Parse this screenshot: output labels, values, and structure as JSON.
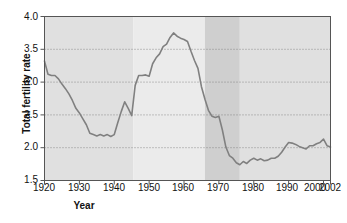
{
  "chart_data": {
    "type": "line",
    "title": "",
    "xlabel": "Year",
    "ylabel": "Total fertility rate",
    "xlim": [
      1920,
      2002
    ],
    "ylim": [
      1.5,
      4.0
    ],
    "grid": true,
    "legend": "none",
    "yticks": [
      "4.0",
      "3.5",
      "3.0",
      "2.5",
      "2.0",
      "1.5"
    ],
    "ytick_values": [
      4.0,
      3.5,
      3.0,
      2.5,
      2.0,
      1.5
    ],
    "xticks": [
      "1920",
      "1930",
      "1940",
      "1950",
      "1960",
      "1970",
      "1980",
      "1990",
      "2000",
      "2002"
    ],
    "xtick_values": [
      1920,
      1930,
      1940,
      1950,
      1960,
      1970,
      1980,
      1990,
      2000,
      2002
    ],
    "series": [
      {
        "name": "Total fertility rate",
        "color": "#808080",
        "x": [
          1920,
          1921,
          1922,
          1923,
          1924,
          1925,
          1926,
          1927,
          1928,
          1929,
          1930,
          1931,
          1932,
          1933,
          1934,
          1935,
          1936,
          1937,
          1938,
          1939,
          1940,
          1941,
          1942,
          1943,
          1944,
          1945,
          1946,
          1947,
          1948,
          1949,
          1950,
          1951,
          1952,
          1953,
          1954,
          1955,
          1956,
          1957,
          1958,
          1959,
          1960,
          1961,
          1962,
          1963,
          1964,
          1965,
          1966,
          1967,
          1968,
          1969,
          1970,
          1971,
          1972,
          1973,
          1974,
          1975,
          1976,
          1977,
          1978,
          1979,
          1980,
          1981,
          1982,
          1983,
          1984,
          1985,
          1986,
          1987,
          1988,
          1989,
          1990,
          1991,
          1992,
          1993,
          1994,
          1995,
          1996,
          1997,
          1998,
          1999,
          2000,
          2001,
          2002
        ],
        "y": [
          3.32,
          3.12,
          3.1,
          3.1,
          3.05,
          2.97,
          2.9,
          2.82,
          2.72,
          2.6,
          2.53,
          2.44,
          2.35,
          2.22,
          2.2,
          2.18,
          2.2,
          2.18,
          2.2,
          2.17,
          2.2,
          2.38,
          2.55,
          2.7,
          2.6,
          2.49,
          2.95,
          3.1,
          3.1,
          3.11,
          3.09,
          3.28,
          3.37,
          3.43,
          3.54,
          3.58,
          3.68,
          3.75,
          3.7,
          3.67,
          3.65,
          3.62,
          3.47,
          3.33,
          3.21,
          2.93,
          2.74,
          2.57,
          2.48,
          2.46,
          2.48,
          2.27,
          2.01,
          1.88,
          1.84,
          1.77,
          1.74,
          1.79,
          1.76,
          1.81,
          1.84,
          1.81,
          1.83,
          1.8,
          1.81,
          1.84,
          1.84,
          1.87,
          1.93,
          2.01,
          2.08,
          2.07,
          2.05,
          2.02,
          2.0,
          1.98,
          2.03,
          2.03,
          2.06,
          2.08,
          2.13,
          2.03,
          2.01
        ]
      }
    ],
    "bands": [
      {
        "name": "pre-boom",
        "start": 1920,
        "end": 1945.5,
        "color": "#e0e0e0",
        "label": ""
      },
      {
        "name": "baby-boom",
        "start": 1945.5,
        "end": 1966.0,
        "color": "#ebebeb",
        "label": "Baby boom"
      },
      {
        "name": "baby-bust",
        "start": 1966.0,
        "end": 1976.0,
        "color": "#cfcfcf",
        "label": "Baby bust"
      },
      {
        "name": "post-bust",
        "start": 1976.0,
        "end": 2002,
        "color": "#e0e0e0",
        "label": ""
      }
    ],
    "annotations": [
      {
        "name": "baby-boom-label",
        "line1": "Baby",
        "line2": "boom",
        "x": 1955.5,
        "y": 2.86
      },
      {
        "name": "baby-bust-label",
        "line1": "Baby",
        "line2": "bust",
        "x": 1971.0,
        "y": 2.86
      }
    ]
  },
  "colors": {
    "line": "#808080",
    "axis": "#555555",
    "grid": "#777777",
    "text": "#111111",
    "plot_bg": "#e0e0e0"
  }
}
